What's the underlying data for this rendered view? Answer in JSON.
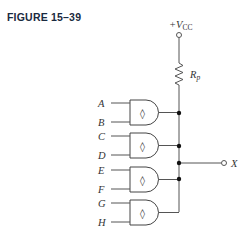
{
  "figure": {
    "title": "FIGURE 15–39"
  },
  "supply": {
    "label": "+V",
    "subscript": "CC"
  },
  "resistor": {
    "label": "R",
    "subscript": "p"
  },
  "gates": [
    {
      "inputs": [
        "A",
        "B"
      ],
      "symbol": "◊"
    },
    {
      "inputs": [
        "C",
        "D"
      ],
      "symbol": "◊"
    },
    {
      "inputs": [
        "E",
        "F"
      ],
      "symbol": "◊"
    },
    {
      "inputs": [
        "G",
        "H"
      ],
      "symbol": "◊"
    }
  ],
  "output": {
    "label": "X"
  },
  "colors": {
    "line": "#555555",
    "title": "#1a2a40"
  }
}
